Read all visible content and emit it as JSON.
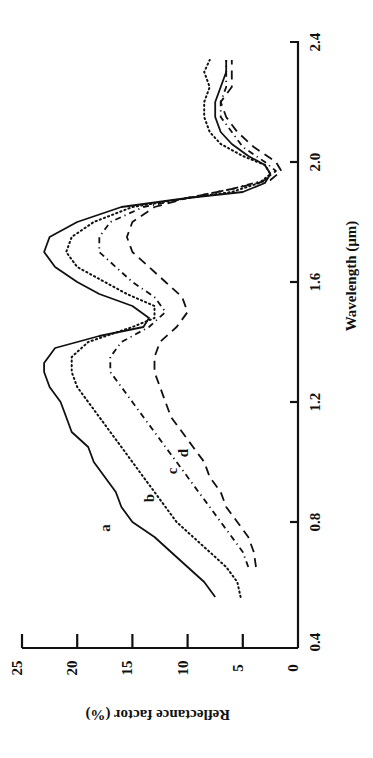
{
  "chart_data": {
    "type": "line",
    "title": "",
    "xlabel": "Wavelength (µm)",
    "ylabel": "Reflectance factor (%)",
    "xlim": [
      0.4,
      2.4
    ],
    "ylim": [
      0,
      25
    ],
    "x_ticks": [
      "0.4",
      "0.8",
      "1.2",
      "1.6",
      "2.0",
      "2.4"
    ],
    "y_ticks": [
      "0",
      "5",
      "10",
      "15",
      "20",
      "25"
    ],
    "grid": false,
    "legend": "inline curve labels a, b, c, d",
    "orientation": "rotated 90° counter-clockwise",
    "series": [
      {
        "name": "a",
        "style": "solid",
        "x": [
          0.55,
          0.6,
          0.65,
          0.7,
          0.75,
          0.8,
          0.85,
          0.9,
          0.95,
          1.0,
          1.05,
          1.1,
          1.15,
          1.2,
          1.25,
          1.3,
          1.33,
          1.38,
          1.42,
          1.45,
          1.48,
          1.52,
          1.56,
          1.6,
          1.65,
          1.7,
          1.75,
          1.8,
          1.85,
          1.88,
          1.9,
          1.93,
          1.96,
          1.99,
          2.02,
          2.06,
          2.1,
          2.15,
          2.2,
          2.25,
          2.3,
          2.34
        ],
        "y": [
          7.5,
          8.5,
          10.0,
          11.5,
          13.0,
          15.0,
          16.0,
          16.5,
          17.5,
          18.5,
          19.0,
          20.5,
          21.0,
          21.5,
          22.5,
          23.0,
          23.0,
          22.0,
          18.0,
          14.0,
          13.5,
          15.0,
          18.0,
          20.0,
          22.0,
          23.0,
          22.5,
          20.0,
          16.0,
          10.0,
          5.0,
          3.0,
          2.5,
          3.0,
          4.5,
          6.0,
          7.0,
          7.5,
          7.5,
          7.0,
          6.5,
          6.5
        ]
      },
      {
        "name": "b",
        "style": "dotted",
        "x": [
          0.55,
          0.6,
          0.65,
          0.7,
          0.75,
          0.8,
          0.85,
          0.9,
          0.95,
          1.0,
          1.05,
          1.1,
          1.15,
          1.2,
          1.25,
          1.3,
          1.35,
          1.4,
          1.45,
          1.48,
          1.52,
          1.56,
          1.6,
          1.65,
          1.7,
          1.75,
          1.8,
          1.85,
          1.88,
          1.9,
          1.93,
          1.96,
          1.99,
          2.02,
          2.06,
          2.1,
          2.15,
          2.2,
          2.25,
          2.3,
          2.34
        ],
        "y": [
          5.2,
          5.5,
          6.5,
          8.0,
          9.5,
          11.0,
          12.0,
          13.0,
          14.0,
          15.0,
          16.0,
          17.0,
          18.0,
          19.0,
          20.0,
          20.5,
          20.5,
          19.0,
          15.0,
          13.0,
          13.0,
          15.5,
          17.5,
          20.0,
          21.0,
          20.5,
          18.5,
          15.0,
          10.0,
          6.0,
          3.5,
          2.5,
          3.0,
          5.0,
          7.0,
          8.0,
          8.5,
          8.5,
          8.0,
          8.5,
          8.0
        ]
      },
      {
        "name": "c",
        "style": "dash-dot",
        "x": [
          0.65,
          0.7,
          0.75,
          0.8,
          0.85,
          0.9,
          0.95,
          1.0,
          1.05,
          1.1,
          1.15,
          1.2,
          1.25,
          1.3,
          1.35,
          1.4,
          1.45,
          1.5,
          1.55,
          1.6,
          1.65,
          1.7,
          1.75,
          1.8,
          1.85,
          1.88,
          1.91,
          1.94,
          1.97,
          2.0,
          2.05,
          2.1,
          2.15,
          2.2,
          2.25,
          2.3,
          2.34
        ],
        "y": [
          4.5,
          5.0,
          6.0,
          7.0,
          8.0,
          9.0,
          10.0,
          11.0,
          12.0,
          13.0,
          14.0,
          15.0,
          16.0,
          17.0,
          17.0,
          16.0,
          13.5,
          12.0,
          13.0,
          15.0,
          16.5,
          18.0,
          18.0,
          17.0,
          14.0,
          10.0,
          6.0,
          3.0,
          2.0,
          3.0,
          5.0,
          6.0,
          7.0,
          7.0,
          6.5,
          6.5,
          6.5
        ]
      },
      {
        "name": "d",
        "style": "dashed",
        "x": [
          0.65,
          0.7,
          0.75,
          0.8,
          0.85,
          0.9,
          0.95,
          1.0,
          1.05,
          1.1,
          1.15,
          1.2,
          1.25,
          1.3,
          1.35,
          1.4,
          1.45,
          1.5,
          1.55,
          1.6,
          1.65,
          1.7,
          1.75,
          1.8,
          1.85,
          1.88,
          1.91,
          1.94,
          1.97,
          2.0,
          2.05,
          2.1,
          2.15,
          2.2,
          2.25,
          2.3,
          2.34
        ],
        "y": [
          3.8,
          4.0,
          4.5,
          5.5,
          6.5,
          7.0,
          8.0,
          8.5,
          9.5,
          10.5,
          11.5,
          12.0,
          12.5,
          13.0,
          13.0,
          12.5,
          11.0,
          10.0,
          10.5,
          12.0,
          13.5,
          15.0,
          15.5,
          15.0,
          13.0,
          10.0,
          6.0,
          2.5,
          1.5,
          2.0,
          4.0,
          5.5,
          6.5,
          7.0,
          6.0,
          6.0,
          6.0
        ]
      }
    ],
    "annotations": [
      {
        "text": "a",
        "x": 0.78,
        "y": 17.0
      },
      {
        "text": "b",
        "x": 0.88,
        "y": 13.0
      },
      {
        "text": "c",
        "x": 0.97,
        "y": 11.0
      },
      {
        "text": "d",
        "x": 1.03,
        "y": 10.0
      }
    ]
  }
}
